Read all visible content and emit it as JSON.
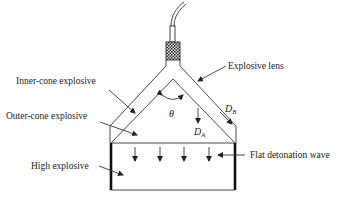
{
  "diagram": {
    "labels": {
      "explosive_lens": "Explosive  lens",
      "inner_cone": "Inner-cone  explosive",
      "outer_cone": "Outer-cone  explosive",
      "high_explosive": "High  explosive",
      "flat_wave": "Flat  detonation  wave"
    },
    "symbols": {
      "theta": "θ",
      "d_a": "D",
      "d_a_sub": "A",
      "d_b": "D",
      "d_b_sub": "B"
    },
    "colors": {
      "line": "#333333",
      "background": "#ffffff",
      "detonator": "#555555"
    }
  }
}
